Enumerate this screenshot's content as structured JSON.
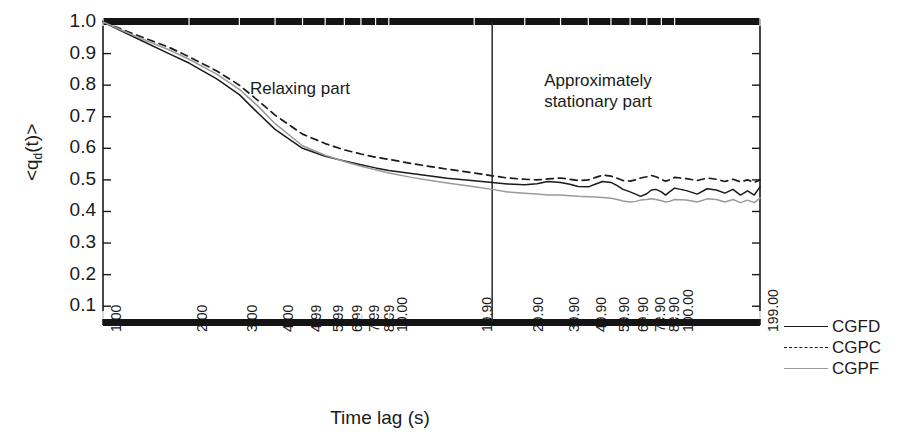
{
  "axes": {
    "ylabel": "<q",
    "ylabel_sub": "d",
    "ylabel_tail": "(t)>",
    "ylabel_full": "<qd(t)>",
    "xlabel": "Time lag (s)",
    "yticks": [
      "1.0",
      "0.9",
      "0.8",
      "0.7",
      "0.6",
      "0.5",
      "0.4",
      "0.3",
      "0.2",
      "0.1"
    ],
    "xticks": [
      "1.00",
      "2.00",
      "3.00",
      "4.00",
      "4.99",
      "5.99",
      "6.99",
      "7.99",
      "8.99",
      "10.00",
      "19.90",
      "29.90",
      "39.90",
      "49.90",
      "59.90",
      "69.90",
      "79.90",
      "89.90",
      "100.00",
      "199.00"
    ]
  },
  "annotations": [
    {
      "text": "Relaxing part",
      "x": 300,
      "y": 78
    },
    {
      "text": "Approximately\nstationary part",
      "x": 598,
      "y": 70
    }
  ],
  "legend": {
    "position": "right",
    "items": [
      {
        "label": "CGFD",
        "style": "solid-dark",
        "color": "#1a1a1a"
      },
      {
        "label": "CGPC",
        "style": "dashed-dark",
        "color": "#1a1a1a"
      },
      {
        "label": "CGPF",
        "style": "solid-gray",
        "color": "#9a9a9a"
      }
    ]
  },
  "chart_data": {
    "type": "line",
    "title": "",
    "xlabel": "Time lag (s)",
    "ylabel": "<qd(t)>",
    "xscale": "log",
    "xlim": [
      1.0,
      199.0
    ],
    "ylim": [
      0.05,
      1.0
    ],
    "grid": false,
    "legend_position": "right",
    "divider": {
      "x_value": 23.0,
      "label": "relaxing / stationary boundary"
    },
    "xticklabels": [
      "1.00",
      "2.00",
      "3.00",
      "4.00",
      "4.99",
      "5.99",
      "6.99",
      "7.99",
      "8.99",
      "10.00",
      "19.90",
      "29.90",
      "39.90",
      "49.90",
      "59.90",
      "69.90",
      "79.90",
      "89.90",
      "100.00",
      "199.00"
    ],
    "yticklabels": [
      "0.1",
      "0.2",
      "0.3",
      "0.4",
      "0.5",
      "0.6",
      "0.7",
      "0.8",
      "0.9",
      "1.0"
    ],
    "x": [
      1.0,
      1.3,
      1.7,
      2.0,
      2.5,
      3.0,
      3.5,
      4.0,
      4.99,
      5.99,
      6.99,
      7.99,
      8.99,
      10.0,
      12.0,
      14.0,
      16.0,
      19.9,
      23.0,
      26.0,
      29.9,
      33.0,
      36.0,
      39.9,
      43.0,
      46.0,
      49.9,
      53.0,
      56.0,
      59.9,
      63.0,
      66.0,
      69.9,
      73.0,
      76.0,
      79.9,
      83.0,
      86.0,
      89.9,
      93.0,
      96.0,
      100.0,
      110.0,
      120.0,
      130.0,
      140.0,
      150.0,
      160.0,
      170.0,
      180.0,
      190.0,
      199.0
    ],
    "series": [
      {
        "name": "CGFD",
        "style": "solid",
        "color": "#1a1a1a",
        "values": [
          1.0,
          0.95,
          0.9,
          0.87,
          0.82,
          0.77,
          0.71,
          0.66,
          0.6,
          0.575,
          0.56,
          0.548,
          0.538,
          0.53,
          0.52,
          0.512,
          0.505,
          0.497,
          0.492,
          0.487,
          0.485,
          0.488,
          0.495,
          0.492,
          0.486,
          0.479,
          0.478,
          0.487,
          0.495,
          0.492,
          0.482,
          0.47,
          0.462,
          0.455,
          0.448,
          0.456,
          0.468,
          0.47,
          0.462,
          0.452,
          0.462,
          0.474,
          0.466,
          0.455,
          0.472,
          0.468,
          0.458,
          0.47,
          0.452,
          0.465,
          0.452,
          0.478
        ]
      },
      {
        "name": "CGPC",
        "style": "dashed",
        "color": "#1a1a1a",
        "values": [
          1.0,
          0.96,
          0.92,
          0.89,
          0.845,
          0.8,
          0.75,
          0.705,
          0.645,
          0.615,
          0.595,
          0.582,
          0.572,
          0.565,
          0.552,
          0.542,
          0.534,
          0.522,
          0.513,
          0.506,
          0.502,
          0.5,
          0.503,
          0.506,
          0.502,
          0.498,
          0.5,
          0.508,
          0.515,
          0.512,
          0.505,
          0.498,
          0.496,
          0.5,
          0.506,
          0.51,
          0.514,
          0.51,
          0.502,
          0.496,
          0.5,
          0.508,
          0.504,
          0.498,
          0.506,
          0.502,
          0.495,
          0.502,
          0.494,
          0.5,
          0.492,
          0.5
        ]
      },
      {
        "name": "CGPF",
        "style": "solid",
        "color": "#9a9a9a",
        "values": [
          1.0,
          0.955,
          0.912,
          0.882,
          0.835,
          0.787,
          0.732,
          0.678,
          0.608,
          0.578,
          0.558,
          0.543,
          0.532,
          0.522,
          0.508,
          0.498,
          0.49,
          0.478,
          0.47,
          0.462,
          0.458,
          0.455,
          0.452,
          0.452,
          0.45,
          0.448,
          0.447,
          0.446,
          0.444,
          0.442,
          0.438,
          0.433,
          0.43,
          0.432,
          0.436,
          0.438,
          0.44,
          0.438,
          0.434,
          0.43,
          0.432,
          0.438,
          0.436,
          0.43,
          0.44,
          0.438,
          0.43,
          0.438,
          0.428,
          0.436,
          0.428,
          0.442
        ]
      }
    ]
  }
}
